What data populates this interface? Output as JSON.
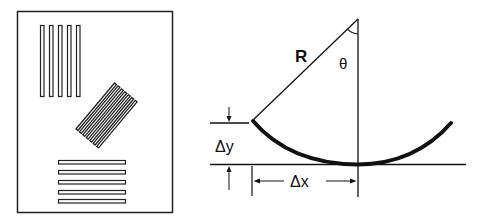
{
  "figure": {
    "left_panel": {
      "description": "Sheet with three groups of bar patterns at different orientations",
      "vertical_bars_count": 5,
      "tilted_bars_count": 7,
      "horizontal_bars_count": 5
    },
    "right_panel": {
      "labels": {
        "radius": "R",
        "angle": "θ",
        "delta_y": "Δy",
        "delta_x": "Δx"
      }
    },
    "colors": {
      "stroke": "#111111",
      "background": "#ffffff"
    }
  }
}
